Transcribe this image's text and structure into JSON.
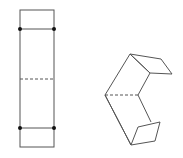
{
  "diagram": {
    "stroke_color": "#555555",
    "dot_color": "#111111",
    "flat_strip": {
      "outline": {
        "x": 20,
        "y": 10,
        "width": 34,
        "height": 137
      },
      "fold_lines_solid_y": [
        29,
        128
      ],
      "fold_line_dashed_y": 79,
      "dots": [
        [
          20,
          29
        ],
        [
          54,
          29
        ],
        [
          20,
          128
        ],
        [
          54,
          128
        ]
      ]
    },
    "folded_shape": {
      "upper_panel": [
        [
          105,
          95
        ],
        [
          130,
          54
        ],
        [
          150,
          73
        ],
        [
          138,
          95
        ]
      ],
      "upper_flap": [
        [
          130,
          54
        ],
        [
          161,
          59
        ],
        [
          172,
          74
        ],
        [
          150,
          73
        ]
      ],
      "lower_panel": [
        [
          105,
          95
        ],
        [
          138,
          95
        ],
        [
          153,
          123
        ],
        [
          131,
          145
        ]
      ],
      "lower_flap": [
        [
          131,
          145
        ],
        [
          138,
          127
        ],
        [
          160,
          122
        ],
        [
          155,
          141
        ]
      ],
      "dashed_fold": [
        [
          105,
          95
        ],
        [
          138,
          95
        ]
      ]
    }
  }
}
